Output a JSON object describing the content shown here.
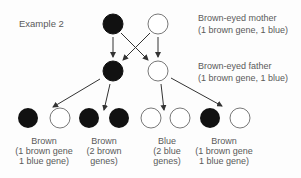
{
  "title": "Example 2",
  "mother": {
    "label": "Brown-eyed mother",
    "genes": "(1 brown gene, 1 blue)",
    "alleles": [
      "brown",
      "blue"
    ]
  },
  "father": {
    "label": "Brown-eyed father",
    "genes": "(1 brown gene, 1 blue)",
    "alleles": [
      "brown",
      "blue"
    ]
  },
  "offspring": [
    {
      "eye_color": "Brown",
      "line1": "(1 brown gene",
      "line2": "1 blue gene)",
      "alleles": [
        "brown",
        "blue"
      ]
    },
    {
      "eye_color": "Brown",
      "line1": "(2 brown",
      "line2": "genes)",
      "alleles": [
        "brown",
        "brown"
      ]
    },
    {
      "eye_color": "Blue",
      "line1": "(2 blue",
      "line2": "genes)",
      "alleles": [
        "blue",
        "blue"
      ]
    },
    {
      "eye_color": "Brown",
      "line1": "(1 brown gene",
      "line2": "1 blue gene)",
      "alleles": [
        "brown",
        "blue"
      ]
    }
  ],
  "colors": {
    "brown_gene": "#111111",
    "blue_gene": "#ffffff",
    "stroke": "#333333"
  }
}
